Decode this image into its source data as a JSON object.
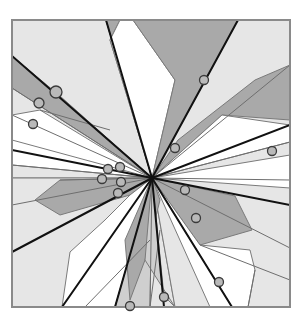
{
  "diagram": {
    "kind": "radial polygon arrangement with marked points",
    "frame": {
      "x": 12,
      "y": 20,
      "w": 278,
      "h": 287
    },
    "center": [
      152,
      178
    ],
    "colors": {
      "white": "#ffffff",
      "light": "#e6e6e6",
      "mid": "#cfcfcf",
      "dark": "#a9a9a9",
      "line_thick": "#111111",
      "line_thin": "#6e6e6e",
      "point_fill": "#b9b9b9",
      "point_stroke": "#3a3a3a",
      "frame": "#8a8a8a"
    },
    "polygons": [
      {
        "fill": "light",
        "pts": [
          [
            12,
            20
          ],
          [
            106,
            20
          ],
          [
            152,
            178
          ],
          [
            12,
            178
          ]
        ]
      },
      {
        "fill": "light",
        "pts": [
          [
            106,
            20
          ],
          [
            290,
            20
          ],
          [
            290,
            307
          ],
          [
            152,
            178
          ]
        ]
      },
      {
        "fill": "light",
        "pts": [
          [
            12,
            178
          ],
          [
            152,
            178
          ],
          [
            175,
            307
          ],
          [
            12,
            307
          ]
        ]
      },
      {
        "fill": "light",
        "pts": [
          [
            152,
            178
          ],
          [
            290,
            180
          ],
          [
            290,
            307
          ],
          [
            175,
            307
          ]
        ]
      },
      {
        "fill": "dark",
        "pts": [
          [
            106,
            20
          ],
          [
            120,
            20
          ],
          [
            110,
            40
          ],
          [
            152,
            178
          ]
        ]
      },
      {
        "fill": "white",
        "pts": [
          [
            120,
            20
          ],
          [
            133,
            20
          ],
          [
            175,
            80
          ],
          [
            152,
            178
          ],
          [
            110,
            40
          ]
        ]
      },
      {
        "fill": "dark",
        "pts": [
          [
            133,
            20
          ],
          [
            238,
            20
          ],
          [
            152,
            178
          ],
          [
            175,
            80
          ]
        ]
      },
      {
        "fill": "dark",
        "pts": [
          [
            12,
            56
          ],
          [
            60,
            96
          ],
          [
            152,
            178
          ],
          [
            12,
            88
          ]
        ]
      },
      {
        "fill": "white",
        "pts": [
          [
            12,
            115
          ],
          [
            40,
            110
          ],
          [
            152,
            178
          ],
          [
            12,
            150
          ]
        ]
      },
      {
        "fill": "white",
        "pts": [
          [
            12,
            140
          ],
          [
            152,
            178
          ],
          [
            12,
            165
          ]
        ]
      },
      {
        "fill": "dark",
        "pts": [
          [
            255,
            80
          ],
          [
            290,
            65
          ],
          [
            290,
            120
          ],
          [
            222,
            115
          ],
          [
            152,
            178
          ],
          [
            178,
            140
          ]
        ]
      },
      {
        "fill": "white",
        "pts": [
          [
            152,
            178
          ],
          [
            222,
            115
          ],
          [
            290,
            125
          ],
          [
            290,
            142
          ]
        ]
      },
      {
        "fill": "white",
        "pts": [
          [
            152,
            178
          ],
          [
            290,
            155
          ],
          [
            290,
            188
          ]
        ]
      },
      {
        "fill": "dark",
        "pts": [
          [
            35,
            200
          ],
          [
            60,
            180
          ],
          [
            152,
            178
          ],
          [
            130,
            195
          ],
          [
            60,
            215
          ]
        ]
      },
      {
        "fill": "white",
        "pts": [
          [
            152,
            178
          ],
          [
            130,
            195
          ],
          [
            105,
            220
          ],
          [
            70,
            252
          ],
          [
            62,
            307
          ],
          [
            115,
            307
          ]
        ]
      },
      {
        "fill": "mid",
        "pts": [
          [
            152,
            178
          ],
          [
            115,
            307
          ],
          [
            150,
            307
          ]
        ]
      },
      {
        "fill": "dark",
        "pts": [
          [
            152,
            178
          ],
          [
            160,
            200
          ],
          [
            145,
            260
          ],
          [
            130,
            300
          ],
          [
            125,
            240
          ]
        ]
      },
      {
        "fill": "mid",
        "pts": [
          [
            152,
            178
          ],
          [
            164,
            296
          ],
          [
            175,
            307
          ],
          [
            145,
            260
          ]
        ]
      },
      {
        "fill": "dark",
        "pts": [
          [
            152,
            178
          ],
          [
            235,
            196
          ],
          [
            252,
            230
          ],
          [
            200,
            245
          ]
        ]
      },
      {
        "fill": "white",
        "pts": [
          [
            152,
            178
          ],
          [
            200,
            245
          ],
          [
            250,
            250
          ],
          [
            255,
            270
          ],
          [
            248,
            307
          ],
          [
            232,
            307
          ]
        ]
      },
      {
        "fill": "white",
        "pts": [
          [
            152,
            178
          ],
          [
            232,
            307
          ],
          [
            210,
            307
          ]
        ]
      }
    ],
    "thick_lines": [
      [
        [
          106,
          20
        ],
        [
          152,
          178
        ]
      ],
      [
        [
          238,
          20
        ],
        [
          152,
          178
        ]
      ],
      [
        [
          12,
          56
        ],
        [
          152,
          178
        ]
      ],
      [
        [
          12,
          150
        ],
        [
          152,
          178
        ]
      ],
      [
        [
          290,
          125
        ],
        [
          152,
          178
        ]
      ],
      [
        [
          290,
          205
        ],
        [
          152,
          178
        ]
      ],
      [
        [
          12,
          252
        ],
        [
          152,
          178
        ]
      ],
      [
        [
          62,
          307
        ],
        [
          152,
          178
        ]
      ],
      [
        [
          115,
          307
        ],
        [
          152,
          178
        ]
      ],
      [
        [
          164,
          307
        ],
        [
          152,
          178
        ]
      ],
      [
        [
          232,
          307
        ],
        [
          152,
          178
        ]
      ]
    ],
    "thin_lines": [
      [
        [
          12,
          88
        ],
        [
          152,
          178
        ]
      ],
      [
        [
          12,
          115
        ],
        [
          152,
          178
        ]
      ],
      [
        [
          12,
          165
        ],
        [
          152,
          178
        ]
      ],
      [
        [
          40,
          110
        ],
        [
          110,
          130
        ]
      ],
      [
        [
          290,
          65
        ],
        [
          152,
          178
        ]
      ],
      [
        [
          290,
          142
        ],
        [
          152,
          178
        ]
      ],
      [
        [
          290,
          180
        ],
        [
          152,
          178
        ]
      ],
      [
        [
          290,
          248
        ],
        [
          152,
          178
        ]
      ],
      [
        [
          12,
          205
        ],
        [
          152,
          178
        ]
      ],
      [
        [
          150,
          307
        ],
        [
          152,
          178
        ]
      ],
      [
        [
          290,
          280
        ],
        [
          200,
          245
        ]
      ],
      [
        [
          150,
          307
        ],
        [
          160,
          230
        ]
      ],
      [
        [
          255,
          270
        ],
        [
          248,
          307
        ]
      ],
      [
        [
          85,
          307
        ],
        [
          150,
          240
        ]
      ],
      [
        [
          60,
          180
        ],
        [
          152,
          178
        ]
      ]
    ],
    "points": [
      {
        "cx": 56,
        "cy": 92,
        "r": 6
      },
      {
        "cx": 39,
        "cy": 103,
        "r": 5
      },
      {
        "cx": 33,
        "cy": 124,
        "r": 4.5
      },
      {
        "cx": 204,
        "cy": 80,
        "r": 4.5
      },
      {
        "cx": 175,
        "cy": 148,
        "r": 4.5
      },
      {
        "cx": 272,
        "cy": 151,
        "r": 4.5
      },
      {
        "cx": 108,
        "cy": 169,
        "r": 4.5
      },
      {
        "cx": 120,
        "cy": 167,
        "r": 4.5
      },
      {
        "cx": 102,
        "cy": 179,
        "r": 4.5
      },
      {
        "cx": 121,
        "cy": 182,
        "r": 4.5
      },
      {
        "cx": 118,
        "cy": 193,
        "r": 4.5
      },
      {
        "cx": 185,
        "cy": 190,
        "r": 4.5
      },
      {
        "cx": 196,
        "cy": 218,
        "r": 4.5
      },
      {
        "cx": 219,
        "cy": 282,
        "r": 4.5
      },
      {
        "cx": 164,
        "cy": 297,
        "r": 4.5
      },
      {
        "cx": 130,
        "cy": 306,
        "r": 4.5
      }
    ]
  }
}
